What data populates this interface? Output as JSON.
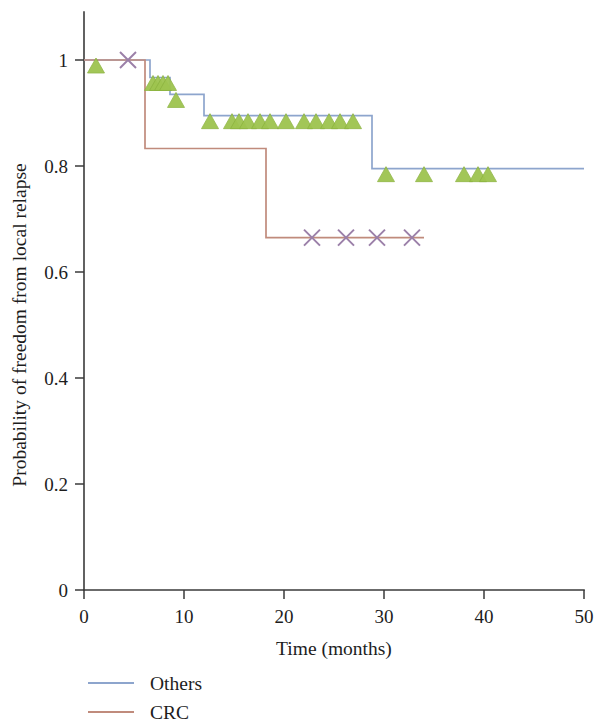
{
  "figure": {
    "type": "kaplan-meier-survival-plot",
    "background": "#ffffff"
  },
  "axes": {
    "x_title": "Time (months)",
    "y_title": "Probability of freedom from local relapse",
    "x_ticks": [
      "0",
      "10",
      "20",
      "30",
      "40",
      "50"
    ],
    "y_ticks": [
      "0",
      "0.2",
      "0.4",
      "0.6",
      "0.8",
      "1"
    ]
  },
  "legend": {
    "items": [
      {
        "label": "Others",
        "color": "#8da5cd"
      },
      {
        "label": "CRC",
        "color": "#c08b7c"
      }
    ]
  },
  "chart_data": {
    "type": "line",
    "title": "",
    "subtitle": "",
    "xlabel": "Time (months)",
    "ylabel": "Probability of freedom from local relapse",
    "xlim": [
      0,
      50
    ],
    "ylim": [
      0,
      1
    ],
    "xticks": [
      0,
      10,
      20,
      30,
      40,
      50
    ],
    "yticks": [
      0,
      0.2,
      0.4,
      0.6,
      0.8,
      1
    ],
    "grid": false,
    "legend_position": "below-left",
    "step_style": "post",
    "series": [
      {
        "name": "Others",
        "color": "#8da5cd",
        "marker": "triangle",
        "marker_color": "#9ec44f",
        "steps": [
          {
            "x": 0.0,
            "y": 1.0
          },
          {
            "x": 6.6,
            "y": 1.0
          },
          {
            "x": 6.6,
            "y": 0.967
          },
          {
            "x": 8.6,
            "y": 0.967
          },
          {
            "x": 8.6,
            "y": 0.935
          },
          {
            "x": 12.0,
            "y": 0.935
          },
          {
            "x": 12.0,
            "y": 0.895
          },
          {
            "x": 28.8,
            "y": 0.895
          },
          {
            "x": 28.8,
            "y": 0.795
          },
          {
            "x": 50.0,
            "y": 0.795
          }
        ],
        "censored": [
          {
            "x": 1.2,
            "y": 1.0
          },
          {
            "x": 6.9,
            "y": 0.967
          },
          {
            "x": 7.4,
            "y": 0.967
          },
          {
            "x": 7.9,
            "y": 0.967
          },
          {
            "x": 8.4,
            "y": 0.967
          },
          {
            "x": 9.2,
            "y": 0.935
          },
          {
            "x": 12.6,
            "y": 0.895
          },
          {
            "x": 14.8,
            "y": 0.895
          },
          {
            "x": 15.5,
            "y": 0.895
          },
          {
            "x": 16.4,
            "y": 0.895
          },
          {
            "x": 17.6,
            "y": 0.895
          },
          {
            "x": 18.6,
            "y": 0.895
          },
          {
            "x": 20.2,
            "y": 0.895
          },
          {
            "x": 22.0,
            "y": 0.895
          },
          {
            "x": 23.2,
            "y": 0.895
          },
          {
            "x": 24.5,
            "y": 0.895
          },
          {
            "x": 25.6,
            "y": 0.895
          },
          {
            "x": 26.9,
            "y": 0.895
          },
          {
            "x": 30.2,
            "y": 0.795
          },
          {
            "x": 34.0,
            "y": 0.795
          },
          {
            "x": 38.0,
            "y": 0.795
          },
          {
            "x": 39.4,
            "y": 0.795
          },
          {
            "x": 40.4,
            "y": 0.795
          }
        ]
      },
      {
        "name": "CRC",
        "color": "#c08b7c",
        "marker": "x",
        "marker_color": "#9b7fa8",
        "steps": [
          {
            "x": 0.0,
            "y": 1.0
          },
          {
            "x": 6.1,
            "y": 1.0
          },
          {
            "x": 6.1,
            "y": 0.833
          },
          {
            "x": 18.2,
            "y": 0.833
          },
          {
            "x": 18.2,
            "y": 0.665
          },
          {
            "x": 34.0,
            "y": 0.665
          }
        ],
        "censored": [
          {
            "x": 4.4,
            "y": 1.0
          },
          {
            "x": 22.8,
            "y": 0.665
          },
          {
            "x": 26.2,
            "y": 0.665
          },
          {
            "x": 29.3,
            "y": 0.665
          },
          {
            "x": 32.8,
            "y": 0.665
          }
        ]
      }
    ]
  }
}
